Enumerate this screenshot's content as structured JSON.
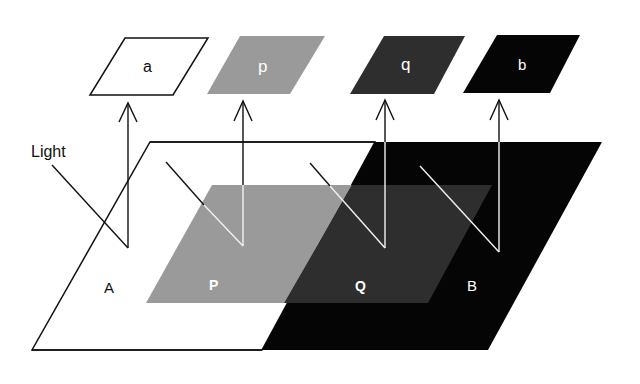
{
  "diagram": {
    "light_label": "Light",
    "surface_labels": {
      "A": "A",
      "P": "P",
      "Q": "Q",
      "B": "B"
    },
    "patch_labels": {
      "a": "a",
      "p": "p",
      "q": "q",
      "b": "b"
    },
    "colors": {
      "white_surface": "#ffffff",
      "light_gray": "#9a9a9a",
      "dark_gray": "#2e2e2e",
      "black": "#050505",
      "outline": "#111111",
      "ray_white": "#f2f2f2"
    }
  }
}
